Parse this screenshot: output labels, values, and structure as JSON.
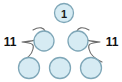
{
  "diagram": {
    "type": "number-bond-tree",
    "colors": {
      "circle_fill": "#d6ebf3",
      "circle_stroke": "#7fa7b8",
      "brace_stroke": "#6b6b6b",
      "text": "#111111",
      "background": "#ffffff"
    },
    "top_row": {
      "circles": [
        {
          "label": "1",
          "cx": 64,
          "cy": 13,
          "r": 9.5
        }
      ]
    },
    "middle_row": {
      "circles": [
        {
          "label": "",
          "cx": 44,
          "cy": 41,
          "r": 10
        },
        {
          "label": "",
          "cx": 78,
          "cy": 41,
          "r": 10
        }
      ]
    },
    "bottom_row": {
      "circles": [
        {
          "label": "",
          "cx": 29,
          "cy": 68,
          "r": 10.5
        },
        {
          "label": "",
          "cx": 60,
          "cy": 68,
          "r": 10.5
        },
        {
          "label": "",
          "cx": 91,
          "cy": 68,
          "r": 10.5
        }
      ]
    },
    "side_labels": {
      "left": {
        "text": "11",
        "x": 10,
        "y": 42
      },
      "right": {
        "text": "11",
        "x": 112,
        "y": 42
      }
    },
    "braces": {
      "left_path": "M 33 30 C 40 26 44 28 45 31 C 46 34 44 36 40 38 C 36 40 34 41 22 42 C 34 43 34 45 33 49 C 32 54 29 58 20 62",
      "right_path": "M 89 30 C 82 26 78 28 77 31 C 76 34 78 36 82 38 C 86 40 88 41 100 42 C 88 43 88 45 89 49 C 90 54 93 58 102 62"
    }
  }
}
